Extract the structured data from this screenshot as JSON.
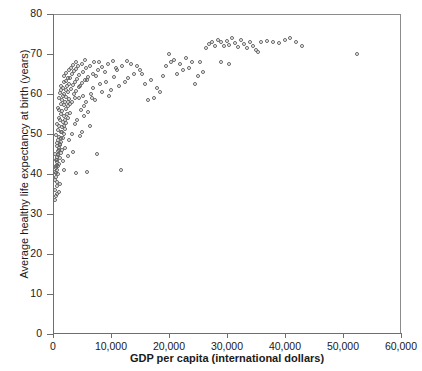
{
  "chart_data": {
    "type": "scatter",
    "title": "",
    "xlabel": "GDP per capita (international dollars)",
    "ylabel": "Average healthy life expectancy at birth (years)",
    "xlim": [
      0,
      60000
    ],
    "ylim": [
      0,
      80
    ],
    "xticks": [
      0,
      10000,
      20000,
      30000,
      40000,
      50000,
      60000
    ],
    "xticklabels": [
      "0",
      "10,000",
      "20,000",
      "30,000",
      "40,000",
      "50,000",
      "60,000"
    ],
    "yticks": [
      0,
      10,
      20,
      30,
      40,
      50,
      60,
      70,
      80
    ],
    "yticklabels": [
      "0",
      "10",
      "20",
      "30",
      "40",
      "50",
      "60",
      "70",
      "80"
    ],
    "grid": false,
    "legend": null,
    "marker": "open-circle",
    "marker_color": "#646464",
    "points": [
      [
        500,
        33.5
      ],
      [
        620,
        34.5
      ],
      [
        380,
        36.0
      ],
      [
        700,
        37.0
      ],
      [
        820,
        38.0
      ],
      [
        450,
        38.5
      ],
      [
        560,
        39.2
      ],
      [
        900,
        39.8
      ],
      [
        640,
        40.2
      ],
      [
        760,
        40.8
      ],
      [
        520,
        41.5
      ],
      [
        980,
        41.8
      ],
      [
        700,
        42.2
      ],
      [
        1150,
        42.5
      ],
      [
        860,
        43.0
      ],
      [
        600,
        43.4
      ],
      [
        1250,
        43.8
      ],
      [
        780,
        44.2
      ],
      [
        1020,
        44.6
      ],
      [
        420,
        45.0
      ],
      [
        1400,
        45.2
      ],
      [
        900,
        45.6
      ],
      [
        1600,
        46.0
      ],
      [
        1100,
        46.4
      ],
      [
        700,
        46.8
      ],
      [
        1300,
        47.2
      ],
      [
        850,
        47.6
      ],
      [
        1500,
        48.0
      ],
      [
        1000,
        48.4
      ],
      [
        1750,
        48.8
      ],
      [
        1200,
        49.2
      ],
      [
        640,
        49.6
      ],
      [
        1900,
        50.0
      ],
      [
        1400,
        50.4
      ],
      [
        980,
        50.8
      ],
      [
        2100,
        51.2
      ],
      [
        1600,
        51.6
      ],
      [
        1150,
        52.0
      ],
      [
        820,
        52.3
      ],
      [
        2400,
        52.6
      ],
      [
        1800,
        53.0
      ],
      [
        1300,
        53.4
      ],
      [
        2700,
        53.8
      ],
      [
        1050,
        54.0
      ],
      [
        2000,
        54.4
      ],
      [
        1500,
        54.8
      ],
      [
        3100,
        55.2
      ],
      [
        1700,
        55.6
      ],
      [
        1200,
        55.9
      ],
      [
        2300,
        56.2
      ],
      [
        900,
        56.5
      ],
      [
        2600,
        56.8
      ],
      [
        1900,
        57.2
      ],
      [
        1400,
        57.5
      ],
      [
        3400,
        57.8
      ],
      [
        2100,
        58.0
      ],
      [
        1600,
        58.3
      ],
      [
        2900,
        58.6
      ],
      [
        1150,
        58.9
      ],
      [
        2400,
        59.2
      ],
      [
        1800,
        59.5
      ],
      [
        3700,
        59.8
      ],
      [
        2000,
        60.0
      ],
      [
        1350,
        60.2
      ],
      [
        2650,
        60.4
      ],
      [
        4100,
        60.6
      ],
      [
        1550,
        60.8
      ],
      [
        2250,
        61.0
      ],
      [
        3200,
        61.2
      ],
      [
        1800,
        61.4
      ],
      [
        4500,
        61.6
      ],
      [
        2500,
        61.8
      ],
      [
        1400,
        62.0
      ],
      [
        3500,
        62.2
      ],
      [
        2800,
        62.4
      ],
      [
        5000,
        62.6
      ],
      [
        2000,
        62.8
      ],
      [
        3800,
        63.0
      ],
      [
        2300,
        63.2
      ],
      [
        5600,
        63.4
      ],
      [
        4200,
        63.6
      ],
      [
        2600,
        63.8
      ],
      [
        3000,
        64.0
      ],
      [
        6200,
        64.2
      ],
      [
        1900,
        64.4
      ],
      [
        4600,
        64.6
      ],
      [
        3300,
        64.8
      ],
      [
        7000,
        65.0
      ],
      [
        2400,
        65.2
      ],
      [
        5200,
        65.4
      ],
      [
        3700,
        65.6
      ],
      [
        2800,
        65.8
      ],
      [
        7800,
        66.0
      ],
      [
        4000,
        66.2
      ],
      [
        5800,
        66.4
      ],
      [
        3200,
        66.5
      ],
      [
        8600,
        66.6
      ],
      [
        4400,
        66.8
      ],
      [
        6400,
        67.0
      ],
      [
        3600,
        67.2
      ],
      [
        9500,
        67.4
      ],
      [
        5000,
        67.5
      ],
      [
        7200,
        67.8
      ],
      [
        4100,
        68.0
      ],
      [
        10400,
        68.2
      ],
      [
        5600,
        68.3
      ],
      [
        8000,
        68.0
      ],
      [
        6000,
        63.5
      ],
      [
        4800,
        62.0
      ],
      [
        7500,
        64.5
      ],
      [
        9000,
        65.5
      ],
      [
        11000,
        66.5
      ],
      [
        12000,
        67.0
      ],
      [
        13000,
        64.0
      ],
      [
        14000,
        65.0
      ],
      [
        15000,
        66.0
      ],
      [
        16000,
        62.5
      ],
      [
        17000,
        63.5
      ],
      [
        18000,
        61.5
      ],
      [
        19000,
        64.5
      ],
      [
        10000,
        61.0
      ],
      [
        11500,
        62.0
      ],
      [
        12500,
        63.0
      ],
      [
        8500,
        60.5
      ],
      [
        9800,
        59.5
      ],
      [
        6800,
        59.0
      ],
      [
        7400,
        58.5
      ],
      [
        5400,
        57.0
      ],
      [
        4900,
        56.0
      ],
      [
        6100,
        55.5
      ],
      [
        5500,
        54.5
      ],
      [
        4300,
        53.5
      ],
      [
        3900,
        52.5
      ],
      [
        5100,
        50.5
      ],
      [
        4700,
        49.5
      ],
      [
        7600,
        45.0
      ],
      [
        4000,
        40.2
      ],
      [
        5900,
        40.5
      ],
      [
        11800,
        41.0
      ],
      [
        3500,
        45.5
      ],
      [
        2900,
        48.5
      ],
      [
        3300,
        50.0
      ],
      [
        6500,
        52.0
      ],
      [
        2600,
        44.5
      ],
      [
        2200,
        46.5
      ],
      [
        1750,
        43.2
      ],
      [
        1050,
        35.5
      ],
      [
        1350,
        37.5
      ],
      [
        780,
        35.0
      ],
      [
        1900,
        41.0
      ],
      [
        21000,
        68.5
      ],
      [
        22000,
        67.5
      ],
      [
        22500,
        66.0
      ],
      [
        23000,
        69.0
      ],
      [
        24000,
        68.0
      ],
      [
        20500,
        67.8
      ],
      [
        25000,
        64.5
      ],
      [
        26000,
        65.5
      ],
      [
        26500,
        71.5
      ],
      [
        27000,
        72.5
      ],
      [
        27500,
        73.0
      ],
      [
        28000,
        72.0
      ],
      [
        28500,
        73.5
      ],
      [
        29000,
        72.8
      ],
      [
        29500,
        71.8
      ],
      [
        30000,
        73.2
      ],
      [
        30500,
        72.2
      ],
      [
        31000,
        73.8
      ],
      [
        31500,
        72.6
      ],
      [
        32000,
        71.6
      ],
      [
        32500,
        73.4
      ],
      [
        33000,
        72.4
      ],
      [
        33500,
        71.4
      ],
      [
        34000,
        73.0
      ],
      [
        34500,
        72.0
      ],
      [
        35000,
        71.0
      ],
      [
        36000,
        72.8
      ],
      [
        37000,
        73.2
      ],
      [
        38000,
        73.0
      ],
      [
        39000,
        72.6
      ],
      [
        40000,
        73.4
      ],
      [
        41000,
        73.8
      ],
      [
        42000,
        72.8
      ],
      [
        43000,
        72.0
      ],
      [
        25500,
        68.0
      ],
      [
        24500,
        62.5
      ],
      [
        23500,
        66.5
      ],
      [
        21500,
        65.0
      ],
      [
        20000,
        70.0
      ],
      [
        19500,
        66.8
      ],
      [
        29000,
        68.0
      ],
      [
        30500,
        67.5
      ],
      [
        35500,
        70.5
      ],
      [
        52500,
        70.0
      ],
      [
        18500,
        60.5
      ],
      [
        17500,
        59.0
      ],
      [
        16500,
        58.5
      ],
      [
        15500,
        64.8
      ],
      [
        14500,
        66.8
      ],
      [
        13500,
        67.5
      ],
      [
        12800,
        68.2
      ],
      [
        11200,
        65.8
      ],
      [
        10600,
        64.2
      ],
      [
        9200,
        63.0
      ],
      [
        8200,
        62.5
      ],
      [
        7000,
        61.5
      ],
      [
        6600,
        60.0
      ],
      [
        5800,
        58.0
      ],
      [
        5300,
        59.5
      ],
      [
        4500,
        58.8
      ],
      [
        3900,
        59.0
      ],
      [
        3100,
        57.5
      ],
      [
        2700,
        58.0
      ],
      [
        2450,
        55.0
      ],
      [
        2150,
        53.5
      ],
      [
        1950,
        52.0
      ],
      [
        1650,
        50.5
      ],
      [
        1450,
        49.0
      ],
      [
        1250,
        47.5
      ],
      [
        1080,
        46.0
      ],
      [
        920,
        44.8
      ],
      [
        760,
        43.5
      ],
      [
        600,
        42.0
      ],
      [
        480,
        40.5
      ]
    ]
  }
}
